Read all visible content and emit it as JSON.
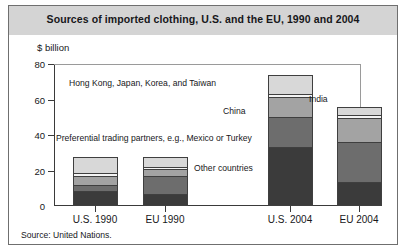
{
  "title": "Sources of imported clothing, U.S. and the EU, 1990 and 2004",
  "axis_unit": "$ billion",
  "source": "Source: United Nations.",
  "annotations": {
    "top_group": "Hong Kong, Japan, Korea, and Taiwan",
    "india": "India",
    "china": "China",
    "preferential": "Preferential trading partners, e.g., Mexico or Turkey",
    "other": "Other countries"
  },
  "colors": {
    "other_countries": "#3b3b3b",
    "preferential": "#6d6d6d",
    "china": "#a3a3a3",
    "india": "#f4f4f4",
    "top_group": "#d8d8d8",
    "title_band": "#d4d4d4",
    "frame": "#6f6f6f",
    "axis": "#3a3a3a"
  },
  "chart_data": {
    "type": "bar",
    "title": "Sources of imported clothing, U.S. and the EU, 1990 and 2004",
    "xlabel": "",
    "ylabel": "$ billion",
    "ylim": [
      0,
      80
    ],
    "yticks": [
      0,
      20,
      40,
      60,
      80
    ],
    "grid": false,
    "legend": "inline annotations",
    "stacked": true,
    "categories": [
      "U.S. 1990",
      "EU 1990",
      "U.S. 2004",
      "EU 2004"
    ],
    "series": [
      {
        "name": "Other countries",
        "values": [
          8.0,
          6.5,
          33.0,
          13.5
        ]
      },
      {
        "name": "Preferential trading partners, e.g., Mexico or Turkey",
        "values": [
          4.0,
          10.5,
          17.5,
          22.5
        ]
      },
      {
        "name": "China",
        "values": [
          5.0,
          4.0,
          11.5,
          14.0
        ]
      },
      {
        "name": "India",
        "values": [
          1.5,
          1.5,
          1.5,
          1.5
        ]
      },
      {
        "name": "Hong Kong, Japan, Korea, and Taiwan",
        "values": [
          9.0,
          5.0,
          10.5,
          4.5
        ]
      }
    ],
    "totals": [
      27.5,
      27.5,
      74.0,
      56.0
    ]
  },
  "ytick_labels": [
    "80",
    "60",
    "40",
    "20",
    "0"
  ]
}
